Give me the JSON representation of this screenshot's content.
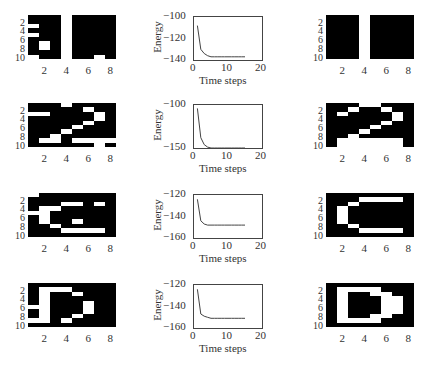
{
  "figure": {
    "rows": [
      {
        "input": {
          "pixels": [
            [
              0,
              0,
              0,
              1,
              0,
              0,
              0,
              0
            ],
            [
              0,
              0,
              0,
              1,
              0,
              0,
              0,
              0
            ],
            [
              1,
              0,
              0,
              1,
              0,
              0,
              0,
              0
            ],
            [
              0,
              0,
              0,
              1,
              0,
              0,
              0,
              0
            ],
            [
              1,
              0,
              0,
              1,
              0,
              0,
              0,
              0
            ],
            [
              0,
              0,
              0,
              1,
              0,
              0,
              0,
              0
            ],
            [
              0,
              1,
              0,
              1,
              0,
              0,
              0,
              0
            ],
            [
              0,
              1,
              0,
              1,
              0,
              0,
              0,
              0
            ],
            [
              0,
              0,
              0,
              1,
              0,
              0,
              0,
              0
            ],
            [
              1,
              0,
              0,
              1,
              0,
              0,
              1,
              0
            ]
          ]
        },
        "energy": {
          "ylim": [
            -140,
            -100
          ],
          "yticks": [
            "-100",
            "-120",
            "-140"
          ],
          "values": [
            -108,
            -130,
            -134,
            -136,
            -137,
            -137,
            -137,
            -137,
            -137,
            -137,
            -137,
            -137,
            -137,
            -137,
            -137
          ]
        },
        "output": {
          "pixels": [
            [
              0,
              0,
              0,
              1,
              0,
              0,
              0,
              0
            ],
            [
              0,
              0,
              0,
              1,
              0,
              0,
              0,
              0
            ],
            [
              0,
              0,
              0,
              1,
              0,
              0,
              0,
              0
            ],
            [
              0,
              0,
              0,
              1,
              0,
              0,
              0,
              0
            ],
            [
              0,
              0,
              0,
              1,
              0,
              0,
              0,
              0
            ],
            [
              0,
              0,
              0,
              1,
              0,
              0,
              0,
              0
            ],
            [
              0,
              0,
              0,
              1,
              0,
              0,
              0,
              0
            ],
            [
              0,
              0,
              0,
              1,
              0,
              0,
              0,
              0
            ],
            [
              0,
              0,
              0,
              1,
              0,
              0,
              0,
              0
            ],
            [
              0,
              0,
              0,
              1,
              0,
              0,
              0,
              0
            ]
          ]
        }
      },
      {
        "input": {
          "pixels": [
            [
              0,
              0,
              0,
              1,
              0,
              0,
              0,
              0
            ],
            [
              0,
              0,
              0,
              0,
              0,
              1,
              0,
              0
            ],
            [
              1,
              1,
              0,
              0,
              0,
              0,
              1,
              0
            ],
            [
              0,
              0,
              0,
              0,
              0,
              0,
              1,
              0
            ],
            [
              0,
              0,
              0,
              0,
              0,
              1,
              0,
              0
            ],
            [
              0,
              0,
              0,
              0,
              1,
              0,
              0,
              0
            ],
            [
              0,
              0,
              0,
              1,
              0,
              0,
              0,
              0
            ],
            [
              0,
              0,
              1,
              0,
              0,
              0,
              0,
              0
            ],
            [
              0,
              1,
              1,
              0,
              1,
              1,
              1,
              1
            ],
            [
              0,
              0,
              0,
              0,
              0,
              0,
              1,
              0
            ]
          ]
        },
        "energy": {
          "ylim": [
            -150,
            -100
          ],
          "yticks": [
            "-100",
            "-150"
          ],
          "values": [
            -104,
            -138,
            -146,
            -149,
            -150,
            -150,
            -150,
            -150,
            -150,
            -150,
            -150,
            -150,
            -150,
            -150,
            -150
          ]
        },
        "output": {
          "pixels": [
            [
              0,
              0,
              0,
              1,
              1,
              0,
              0,
              0
            ],
            [
              0,
              0,
              1,
              0,
              0,
              1,
              0,
              0
            ],
            [
              0,
              1,
              0,
              0,
              0,
              0,
              1,
              0
            ],
            [
              0,
              0,
              0,
              0,
              0,
              0,
              1,
              0
            ],
            [
              0,
              0,
              0,
              0,
              0,
              1,
              0,
              0
            ],
            [
              0,
              0,
              0,
              0,
              1,
              0,
              0,
              0
            ],
            [
              0,
              0,
              0,
              1,
              0,
              0,
              0,
              0
            ],
            [
              0,
              0,
              1,
              0,
              0,
              0,
              0,
              0
            ],
            [
              0,
              1,
              1,
              1,
              1,
              1,
              1,
              0
            ],
            [
              0,
              1,
              1,
              1,
              1,
              1,
              1,
              0
            ]
          ]
        }
      },
      {
        "input": {
          "pixels": [
            [
              1,
              0,
              0,
              0,
              0,
              0,
              0,
              0
            ],
            [
              0,
              0,
              0,
              0,
              0,
              0,
              0,
              0
            ],
            [
              0,
              0,
              0,
              1,
              1,
              0,
              1,
              0
            ],
            [
              0,
              1,
              1,
              0,
              0,
              0,
              0,
              0
            ],
            [
              1,
              1,
              0,
              0,
              0,
              0,
              0,
              0
            ],
            [
              0,
              1,
              0,
              0,
              0,
              0,
              0,
              0
            ],
            [
              0,
              1,
              0,
              0,
              1,
              0,
              0,
              0
            ],
            [
              0,
              0,
              1,
              0,
              0,
              0,
              0,
              0
            ],
            [
              0,
              0,
              0,
              1,
              1,
              1,
              1,
              0
            ],
            [
              0,
              0,
              0,
              0,
              0,
              0,
              0,
              0
            ]
          ]
        },
        "energy": {
          "ylim": [
            -160,
            -120
          ],
          "yticks": [
            "-120",
            "-140",
            "-160"
          ],
          "values": [
            -124,
            -144,
            -147,
            -148,
            -148,
            -148,
            -148,
            -148,
            -148,
            -148,
            -148,
            -148,
            -148,
            -148,
            -148
          ]
        },
        "output": {
          "pixels": [
            [
              0,
              0,
              0,
              0,
              0,
              0,
              0,
              0
            ],
            [
              0,
              0,
              0,
              1,
              1,
              1,
              1,
              0
            ],
            [
              0,
              0,
              1,
              0,
              0,
              0,
              0,
              0
            ],
            [
              0,
              1,
              0,
              0,
              0,
              0,
              0,
              0
            ],
            [
              0,
              1,
              0,
              0,
              0,
              0,
              0,
              0
            ],
            [
              0,
              1,
              0,
              0,
              0,
              0,
              0,
              0
            ],
            [
              0,
              1,
              0,
              0,
              0,
              0,
              0,
              0
            ],
            [
              0,
              0,
              1,
              0,
              0,
              0,
              0,
              0
            ],
            [
              0,
              0,
              0,
              1,
              1,
              1,
              1,
              0
            ],
            [
              0,
              0,
              0,
              0,
              0,
              0,
              0,
              0
            ]
          ]
        }
      },
      {
        "input": {
          "pixels": [
            [
              0,
              0,
              0,
              0,
              0,
              0,
              0,
              0
            ],
            [
              0,
              1,
              1,
              1,
              0,
              0,
              0,
              0
            ],
            [
              0,
              1,
              0,
              0,
              1,
              0,
              0,
              0
            ],
            [
              0,
              1,
              0,
              0,
              0,
              0,
              0,
              0
            ],
            [
              0,
              1,
              0,
              0,
              0,
              1,
              0,
              0
            ],
            [
              1,
              1,
              0,
              0,
              0,
              1,
              0,
              0
            ],
            [
              0,
              1,
              0,
              0,
              0,
              1,
              0,
              0
            ],
            [
              0,
              1,
              0,
              0,
              1,
              0,
              0,
              0
            ],
            [
              1,
              1,
              0,
              1,
              0,
              0,
              0,
              0
            ],
            [
              0,
              0,
              0,
              0,
              0,
              0,
              0,
              0
            ]
          ]
        },
        "energy": {
          "ylim": [
            -160,
            -120
          ],
          "yticks": [
            "-120",
            "-140",
            "-160"
          ],
          "values": [
            -124,
            -147,
            -149,
            -150,
            -151,
            -151,
            -151,
            -151,
            -151,
            -151,
            -151,
            -151,
            -151,
            -151,
            -151
          ]
        },
        "output": {
          "pixels": [
            [
              0,
              0,
              0,
              0,
              0,
              0,
              0,
              0
            ],
            [
              0,
              1,
              1,
              1,
              1,
              0,
              0,
              0
            ],
            [
              0,
              1,
              0,
              0,
              1,
              1,
              0,
              0
            ],
            [
              0,
              1,
              0,
              0,
              0,
              1,
              1,
              0
            ],
            [
              0,
              1,
              0,
              0,
              0,
              1,
              1,
              0
            ],
            [
              0,
              1,
              0,
              0,
              0,
              1,
              1,
              0
            ],
            [
              0,
              1,
              0,
              0,
              0,
              1,
              1,
              0
            ],
            [
              0,
              1,
              0,
              0,
              1,
              1,
              0,
              0
            ],
            [
              0,
              1,
              1,
              1,
              1,
              0,
              0,
              0
            ],
            [
              0,
              0,
              0,
              0,
              0,
              0,
              0,
              0
            ]
          ]
        }
      }
    ],
    "grid_yticks": [
      "2",
      "4",
      "6",
      "8",
      "10"
    ],
    "grid_xticks": [
      "2",
      "4",
      "6",
      "8"
    ],
    "energy_xticks": [
      "0",
      "10",
      "20"
    ],
    "energy_xlim": [
      0,
      20
    ],
    "energy_ylabel": "Energy",
    "energy_xlabel": "Time steps"
  },
  "chart_data": [
    {
      "type": "line",
      "title": "",
      "xlabel": "Time steps",
      "ylabel": "Energy",
      "xlim": [
        0,
        20
      ],
      "ylim": [
        -140,
        -100
      ],
      "x": [
        1,
        2,
        3,
        4,
        5,
        6,
        7,
        8,
        9,
        10,
        11,
        12,
        13,
        14,
        15
      ],
      "series": [
        {
          "name": "energy",
          "values": [
            -108,
            -130,
            -134,
            -136,
            -137,
            -137,
            -137,
            -137,
            -137,
            -137,
            -137,
            -137,
            -137,
            -137,
            -137
          ]
        }
      ]
    },
    {
      "type": "line",
      "title": "",
      "xlabel": "Time steps",
      "ylabel": "Energy",
      "xlim": [
        0,
        20
      ],
      "ylim": [
        -150,
        -100
      ],
      "x": [
        1,
        2,
        3,
        4,
        5,
        6,
        7,
        8,
        9,
        10,
        11,
        12,
        13,
        14,
        15
      ],
      "series": [
        {
          "name": "energy",
          "values": [
            -104,
            -138,
            -146,
            -149,
            -150,
            -150,
            -150,
            -150,
            -150,
            -150,
            -150,
            -150,
            -150,
            -150,
            -150
          ]
        }
      ]
    },
    {
      "type": "line",
      "title": "",
      "xlabel": "Time steps",
      "ylabel": "Energy",
      "xlim": [
        0,
        20
      ],
      "ylim": [
        -160,
        -120
      ],
      "x": [
        1,
        2,
        3,
        4,
        5,
        6,
        7,
        8,
        9,
        10,
        11,
        12,
        13,
        14,
        15
      ],
      "series": [
        {
          "name": "energy",
          "values": [
            -124,
            -144,
            -147,
            -148,
            -148,
            -148,
            -148,
            -148,
            -148,
            -148,
            -148,
            -148,
            -148,
            -148,
            -148
          ]
        }
      ]
    },
    {
      "type": "line",
      "title": "",
      "xlabel": "Time steps",
      "ylabel": "Energy",
      "xlim": [
        0,
        20
      ],
      "ylim": [
        -160,
        -120
      ],
      "x": [
        1,
        2,
        3,
        4,
        5,
        6,
        7,
        8,
        9,
        10,
        11,
        12,
        13,
        14,
        15
      ],
      "series": [
        {
          "name": "energy",
          "values": [
            -124,
            -147,
            -149,
            -150,
            -151,
            -151,
            -151,
            -151,
            -151,
            -151,
            -151,
            -151,
            -151,
            -151,
            -151
          ]
        }
      ]
    }
  ]
}
